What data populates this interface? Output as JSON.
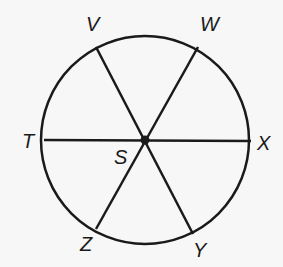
{
  "diagram": {
    "type": "circle-with-diameters",
    "center": {
      "label": "S",
      "x": 145,
      "y": 140
    },
    "radius": 104,
    "points": [
      {
        "label": "V",
        "x": 96,
        "y": 47,
        "lx": 86,
        "ly": 22
      },
      {
        "label": "W",
        "x": 198,
        "y": 47,
        "lx": 201,
        "ly": 22
      },
      {
        "label": "T",
        "x": 44,
        "y": 140,
        "lx": 22,
        "ly": 131
      },
      {
        "label": "X",
        "x": 251,
        "y": 141,
        "lx": 256,
        "ly": 134
      },
      {
        "label": "Z",
        "x": 96,
        "y": 229,
        "lx": 80,
        "ly": 237
      },
      {
        "label": "Y",
        "x": 193,
        "y": 234,
        "lx": 193,
        "ly": 240
      }
    ],
    "center_label_pos": {
      "lx": 114,
      "ly": 150
    },
    "segments": [
      [
        "V",
        "Y"
      ],
      [
        "W",
        "Z"
      ],
      [
        "T",
        "X"
      ]
    ],
    "stroke_color": "#1a1a1a"
  }
}
